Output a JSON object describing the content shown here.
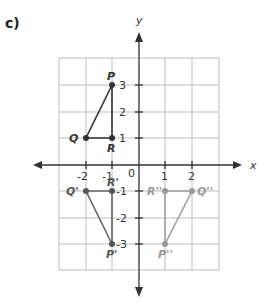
{
  "part_label": "c)",
  "axes": {
    "x_label": "x",
    "y_label": "y",
    "x_ticks": [
      "-2",
      "-1",
      "0",
      "1",
      "2"
    ],
    "y_ticks_pos": [
      "3",
      "2",
      "1"
    ],
    "y_ticks_neg": [
      "-1",
      "-2",
      "-3"
    ],
    "origin_label": "0"
  },
  "colors": {
    "grid": "#bdbdbd",
    "axis": "#333333",
    "original": "#333333",
    "image1": "#666666",
    "image2": "#9a9a9a"
  },
  "triangles": {
    "original": {
      "points": [
        {
          "name": "P",
          "x": -1,
          "y": 3
        },
        {
          "name": "Q",
          "x": -2,
          "y": 1
        },
        {
          "name": "R",
          "x": -1,
          "y": 1
        }
      ]
    },
    "reflection_x": {
      "points": [
        {
          "name": "P'",
          "x": -1,
          "y": -3
        },
        {
          "name": "Q'",
          "x": -2,
          "y": -1
        },
        {
          "name": "R'",
          "x": -1,
          "y": -1
        }
      ]
    },
    "reflection_origin": {
      "points": [
        {
          "name": "P''",
          "x": 1,
          "y": -3
        },
        {
          "name": "Q''",
          "x": 2,
          "y": -1
        },
        {
          "name": "R''",
          "x": 1,
          "y": -1
        }
      ]
    }
  }
}
